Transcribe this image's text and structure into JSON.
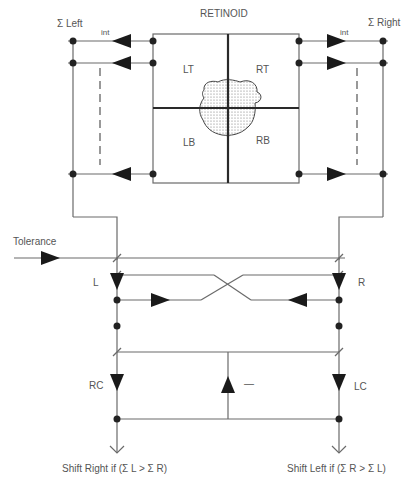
{
  "diagram": {
    "title": "RETINOID",
    "quadrants": {
      "lt": "LT",
      "rt": "RT",
      "lb": "LB",
      "rb": "RB"
    },
    "sum_left": "Σ Left",
    "sum_right": "Σ Right",
    "int_left": "int",
    "int_right": "int",
    "tolerance": "Tolerance",
    "l_label": "L",
    "r_label": "R",
    "rc_label": "RC",
    "lc_label": "LC",
    "minus_label": "—",
    "shift_right": "Shift Right if (Σ L > Σ R)",
    "shift_left": "Shift Left if (Σ R > Σ L)"
  },
  "colors": {
    "line": "#6a6a6a",
    "thick_line": "#2a2a2a",
    "fill": "#1a1a1a",
    "text": "#555555",
    "blob_fill": "#d8d8d8"
  }
}
